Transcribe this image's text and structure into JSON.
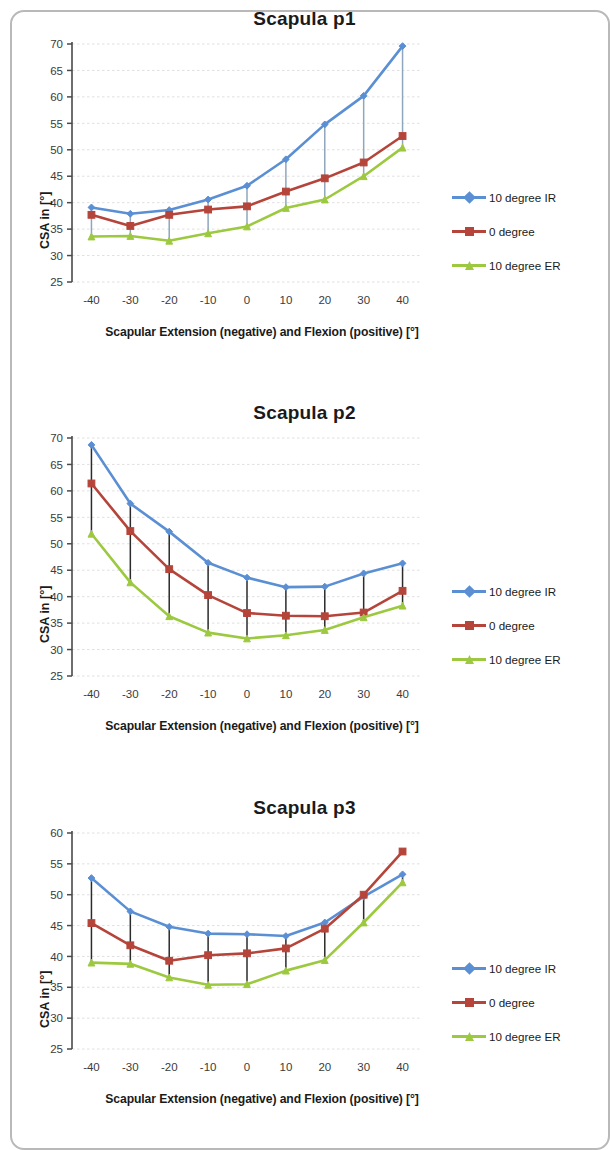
{
  "page": {
    "background": "#ffffff",
    "border_color": "#b9b9b9"
  },
  "series_style": {
    "ir_color": "#5b8fd4",
    "zero_color": "#b5443a",
    "er_color": "#9cc93f",
    "errorbar_color_p1": "#8fa6bd",
    "errorbar_color_p2": "#2b2b2b",
    "errorbar_color_p3": "#2b2b2b",
    "gridline_color": "#d9d9d9",
    "axis_color": "#4a4a4a"
  },
  "legend": {
    "items": [
      {
        "label": "10 degree IR",
        "color": "#5b8fd4",
        "marker": "diamond"
      },
      {
        "label": "0 degree",
        "color": "#b5443a",
        "marker": "square"
      },
      {
        "label": "10 degree ER",
        "color": "#9cc93f",
        "marker": "triangle"
      }
    ]
  },
  "chart_data": [
    {
      "type": "line",
      "title": "Scapula p1",
      "xlabel": "Scapular Extension (negative) and Flexion (positive) [°]",
      "ylabel": "CSA in [°]",
      "x": [
        -40,
        -30,
        -20,
        -10,
        0,
        10,
        20,
        30,
        40
      ],
      "xticklabels": [
        "-40",
        "-30",
        "-20",
        "-10",
        "0",
        "10",
        "20",
        "30",
        "40"
      ],
      "yticks": [
        25,
        30,
        35,
        40,
        45,
        50,
        55,
        60,
        65,
        70
      ],
      "ylim": [
        25,
        70
      ],
      "xlim": [
        -45,
        45
      ],
      "grid": true,
      "legend_position": "right",
      "series": [
        {
          "name": "10 degree IR",
          "color": "#5b8fd4",
          "marker": "diamond",
          "values": [
            39.1,
            37.9,
            38.6,
            40.6,
            43.2,
            48.2,
            54.8,
            60.2,
            69.6
          ]
        },
        {
          "name": "0 degree",
          "color": "#b5443a",
          "marker": "square",
          "values": [
            37.7,
            35.6,
            37.7,
            38.7,
            39.3,
            42.1,
            44.6,
            47.6,
            52.6
          ]
        },
        {
          "name": "10 degree ER",
          "color": "#9cc93f",
          "marker": "triangle",
          "values": [
            33.6,
            33.7,
            32.8,
            34.2,
            35.5,
            39.0,
            40.6,
            45.0,
            50.4
          ]
        }
      ]
    },
    {
      "type": "line",
      "title": "Scapula p2",
      "xlabel": "Scapular Extension (negative) and Flexion (positive) [°]",
      "ylabel": "CSA in [°]",
      "x": [
        -40,
        -30,
        -20,
        -10,
        0,
        10,
        20,
        30,
        40
      ],
      "xticklabels": [
        "-40",
        "-30",
        "-20",
        "-10",
        "0",
        "10",
        "20",
        "30",
        "40"
      ],
      "yticks": [
        25,
        30,
        35,
        40,
        45,
        50,
        55,
        60,
        65,
        70
      ],
      "ylim": [
        25,
        70
      ],
      "xlim": [
        -45,
        45
      ],
      "grid": true,
      "legend_position": "right",
      "series": [
        {
          "name": "10 degree IR",
          "color": "#5b8fd4",
          "marker": "diamond",
          "values": [
            68.7,
            57.6,
            52.3,
            46.4,
            43.6,
            41.8,
            41.9,
            44.4,
            46.3
          ]
        },
        {
          "name": "0 degree",
          "color": "#b5443a",
          "marker": "square",
          "values": [
            61.4,
            52.4,
            45.2,
            40.3,
            36.9,
            36.4,
            36.3,
            37.0,
            41.1
          ]
        },
        {
          "name": "10 degree ER",
          "color": "#9cc93f",
          "marker": "triangle",
          "values": [
            51.9,
            42.7,
            36.3,
            33.2,
            32.1,
            32.7,
            33.7,
            36.1,
            38.3
          ]
        }
      ]
    },
    {
      "type": "line",
      "title": "Scapula p3",
      "xlabel": "Scapular Extension (negative) and Flexion (positive) [°]",
      "ylabel": "CSA in [°]",
      "x": [
        -40,
        -30,
        -20,
        -10,
        0,
        10,
        20,
        30,
        40
      ],
      "xticklabels": [
        "-40",
        "-30",
        "-20",
        "-10",
        "0",
        "10",
        "20",
        "30",
        "40"
      ],
      "yticks": [
        25,
        30,
        35,
        40,
        45,
        50,
        55,
        60
      ],
      "ylim": [
        25,
        60
      ],
      "xlim": [
        -45,
        45
      ],
      "grid": true,
      "legend_position": "right",
      "series": [
        {
          "name": "10 degree IR",
          "color": "#5b8fd4",
          "marker": "diamond",
          "values": [
            52.7,
            47.3,
            44.8,
            43.7,
            43.6,
            43.3,
            45.5,
            49.7,
            53.3
          ]
        },
        {
          "name": "0 degree",
          "color": "#b5443a",
          "marker": "square",
          "values": [
            45.4,
            41.8,
            39.3,
            40.2,
            40.5,
            41.3,
            44.5,
            50.0,
            57.0
          ]
        },
        {
          "name": "10 degree ER",
          "color": "#9cc93f",
          "marker": "triangle",
          "values": [
            39.0,
            38.8,
            36.6,
            35.4,
            35.5,
            37.7,
            39.4,
            45.5,
            52.0
          ]
        }
      ]
    }
  ]
}
